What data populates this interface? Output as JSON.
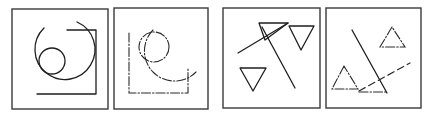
{
  "figure": {
    "panel_count": 4,
    "panels": [
      {
        "id": "panel-1",
        "content": "solid large arc, small circle, right-angle corner bracket"
      },
      {
        "id": "panel-2",
        "content": "dash-dot large arc, small circle, corner bracket (fragmented contours)"
      },
      {
        "id": "panel-3",
        "content": "solid line crossing, three inverted triangles"
      },
      {
        "id": "panel-4",
        "content": "solid line, dashed line, dash-dot upright triangles (fragmented contours)"
      }
    ],
    "colors": {
      "stroke": "#1e1e1e",
      "frame": "#3a3a3a",
      "background": "#ffffff"
    }
  }
}
